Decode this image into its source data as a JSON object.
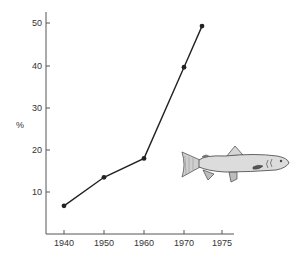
{
  "chart_data": {
    "type": "line",
    "title": "",
    "xlabel": "",
    "ylabel": "%",
    "x": [
      1940,
      1950,
      1960,
      1970,
      1975
    ],
    "categories": [
      "1940",
      "1950",
      "1960",
      "1970",
      "1975"
    ],
    "series": [
      {
        "name": "Percentage",
        "values": [
          6.7,
          13.5,
          18,
          39.7,
          49.5
        ]
      }
    ],
    "values": [
      6.7,
      13.5,
      18,
      39.7,
      49.5
    ],
    "xticks": [
      "1940",
      "1950",
      "1960",
      "1970",
      "1975"
    ],
    "yticks": [
      "10",
      "20",
      "30",
      "40",
      "50"
    ],
    "xlim": [
      1935.5,
      1976.5
    ],
    "ylim": [
      0,
      52.5
    ],
    "grid": false,
    "legend": "none",
    "annotations": [
      "fish-illustration"
    ],
    "colors": {
      "line": "#222222",
      "axis": "#555555",
      "fish_body": "#dcdcdc",
      "fish_outline": "#555555"
    }
  },
  "y_axis": {
    "label": "%",
    "ticks": [
      "10",
      "20",
      "30",
      "40",
      "50"
    ]
  },
  "x_axis": {
    "ticks": [
      "1940",
      "1950",
      "1960",
      "1970",
      "1975"
    ]
  }
}
